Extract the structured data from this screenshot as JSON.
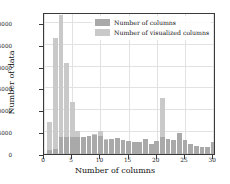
{
  "chart_data": {
    "type": "bar",
    "title": "",
    "xlabel": "Number of columns",
    "ylabel": "Number of data",
    "xlim": [
      0,
      30.5
    ],
    "ylim": [
      0,
      32500
    ],
    "xticks": [
      0,
      5,
      10,
      15,
      20,
      25,
      30
    ],
    "yticks": [
      0,
      5000,
      10000,
      15000,
      20000,
      25000,
      30000
    ],
    "ytick_labels": [
      "0",
      "5000",
      "10000",
      "15000",
      "20000",
      "25000",
      "30000"
    ],
    "xtick_labels": [
      "0",
      "5",
      "10",
      "15",
      "20",
      "25",
      "30"
    ],
    "grid": true,
    "legend_position": "upper right",
    "bin_width": 0.85,
    "x": [
      1,
      2,
      3,
      4,
      5,
      6,
      7,
      8,
      9,
      10,
      11,
      12,
      13,
      14,
      15,
      16,
      17,
      18,
      19,
      20,
      21,
      22,
      23,
      24,
      25,
      26,
      27,
      28,
      29,
      30
    ],
    "series": [
      {
        "name": "Number of visualized columns",
        "color": "#c9c9c9",
        "values": [
          7400,
          26500,
          31800,
          20800,
          11900,
          5200,
          3500,
          3400,
          4500,
          5200,
          3500,
          3500,
          3700,
          3100,
          2900,
          2800,
          2700,
          3500,
          2300,
          2900,
          12800,
          3500,
          3300,
          4900,
          3100,
          2200,
          1800,
          1700,
          1500,
          2700
        ]
      },
      {
        "name": "Number of columns",
        "color": "#a9a9a9",
        "values": [
          900,
          1200,
          3800,
          3800,
          3900,
          3800,
          4000,
          4200,
          4300,
          4200,
          3300,
          3500,
          3700,
          3100,
          2900,
          2800,
          2700,
          3500,
          2300,
          2900,
          3800,
          3500,
          3300,
          4900,
          3100,
          2200,
          1800,
          1700,
          1500,
          2700
        ]
      }
    ]
  },
  "legend": {
    "entries": [
      {
        "label": "Number of columns",
        "color": "#a9a9a9"
      },
      {
        "label": "Number of visualized columns",
        "color": "#c9c9c9"
      }
    ]
  },
  "axes": {
    "x_title": "Number of columns",
    "y_title": "Number of data"
  }
}
